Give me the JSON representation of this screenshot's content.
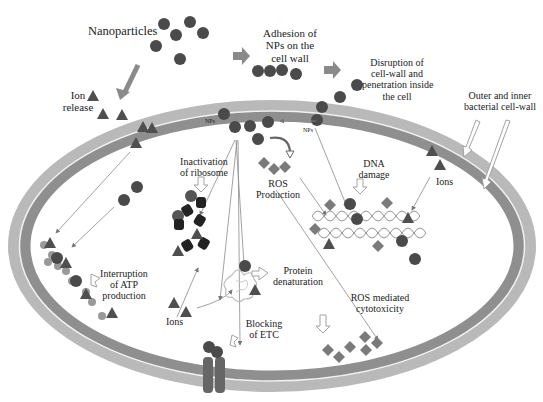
{
  "diagram": {
    "colors": {
      "background": "#ffffff",
      "nanoparticle": "#4a4a4a",
      "ion": "#4f4f4f",
      "ros": "#7a7a7a",
      "outer_wall": "#bdbdbd",
      "inner_wall": "#8f8f8f",
      "wall_line": "#f2f2f2",
      "ribosome": "#222222",
      "arrow_thin": "#777777",
      "arrow_thick": "#8a8a8a",
      "text": "#222222"
    },
    "labels": {
      "nanoparticles": "Nanoparticles",
      "ion_release_1": "Ion",
      "ion_release_2": "release",
      "adhesion_1": "Adhesion of",
      "adhesion_2": "NPs on the",
      "adhesion_3": "cell wall",
      "disruption_1": "Disruption of",
      "disruption_2": "cell-wall and",
      "disruption_3": "penetration inside",
      "disruption_4": "the cell",
      "wall_1": "Outer and inner",
      "wall_2": "bacterial cell-wall",
      "nps_left": "NPs",
      "nps_right": "NPs",
      "ribosome_1": "Inactivation",
      "ribosome_2": "of ribosome",
      "ros_1": "ROS",
      "ros_2": "Production",
      "dna_1": "DNA",
      "dna_2": "damage",
      "ions_right": "Ions",
      "ions_bottom": "Ions",
      "atp_1": "Interruption",
      "atp_2": "of ATP",
      "atp_3": "production",
      "protein_1": "Protein",
      "protein_2": "denaturation",
      "etc_1": "Blocking",
      "etc_2": "of ETC",
      "cytotox_1": "ROS mediated",
      "cytotox_2": "cytotoxicity"
    },
    "icons": {
      "nanoparticle": "filled-circle",
      "ion": "filled-triangle",
      "ros": "filled-diamond",
      "ribosome": "dark-cylinder",
      "protein": "tangled-coil",
      "dna": "double-helix",
      "etc_protein": "membrane-channel"
    }
  }
}
